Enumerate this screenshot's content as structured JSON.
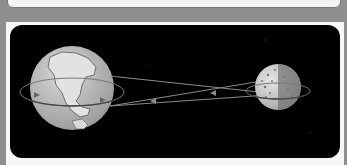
{
  "figure": {
    "background_color": "#000000",
    "earth": {
      "label": "earth-globe",
      "cx": 62,
      "cy": 63,
      "r": 42
    },
    "moon": {
      "label": "moon",
      "cx": 268,
      "cy": 62,
      "r": 23
    }
  },
  "caption": {
    "text": ""
  }
}
